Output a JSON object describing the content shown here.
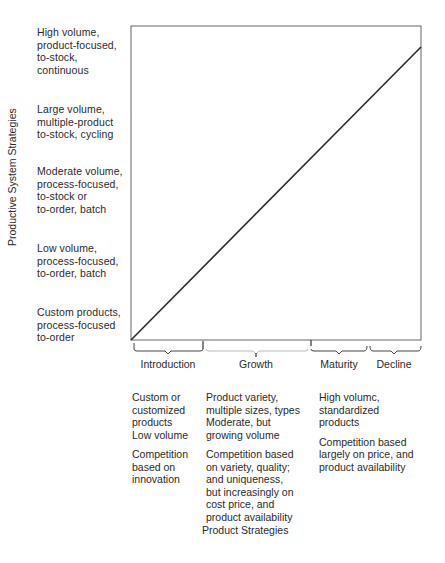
{
  "diagram": {
    "y_axis_title": "Productive System Strategies",
    "x_axis_title": "Product Strategies",
    "productive_system_levels": [
      {
        "lines": [
          "High volume,",
          "product-focused,",
          "to-stock,",
          "continuous"
        ]
      },
      {
        "lines": [
          "Large volume,",
          "multiple-product",
          "to-stock, cycling"
        ]
      },
      {
        "lines": [
          "Moderate volume,",
          "process-focused,",
          "to-stock or",
          "to-order, batch"
        ]
      },
      {
        "lines": [
          "Low volume,",
          "process-focused,",
          "to-order, batch"
        ]
      },
      {
        "lines": [
          "Custom products,",
          "process-focused",
          "to-order"
        ]
      }
    ],
    "phases": [
      {
        "label": "Introduction"
      },
      {
        "label": "Growth"
      },
      {
        "label": "Maturity"
      },
      {
        "label": "Decline"
      }
    ],
    "phase_descriptions": [
      {
        "product": [
          "Custom or",
          "customized",
          "products",
          "Low volume"
        ],
        "competition": [
          "Competition",
          "based on",
          "innovation"
        ]
      },
      {
        "product": [
          "Product variety,",
          "multiple sizes, types",
          "Moderate, but",
          "growing volume"
        ],
        "competition": [
          "Competition based",
          "on variety, quality;",
          "and uniqueness,",
          "but increasingly on",
          "cost price, and",
          "product availability"
        ]
      },
      {
        "product": [
          "High volumc,",
          "standardized",
          "products"
        ],
        "competition": [
          "Competition based",
          "largely on price, and",
          "product availability"
        ]
      }
    ],
    "colors": {
      "line": "#2a2a2a",
      "frame": "#555555",
      "text": "#2a2a2a"
    }
  }
}
